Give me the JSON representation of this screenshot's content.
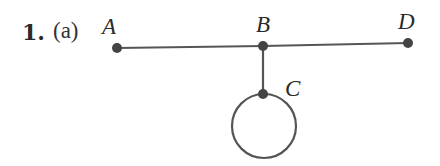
{
  "problem": {
    "number": "1.",
    "part": "(a)"
  },
  "graph": {
    "vertices": [
      {
        "id": "A",
        "label": "A",
        "x": 117,
        "y": 48,
        "label_x": 102,
        "label_y": 14
      },
      {
        "id": "B",
        "label": "B",
        "x": 263,
        "y": 46,
        "label_x": 256,
        "label_y": 12
      },
      {
        "id": "D",
        "label": "D",
        "x": 408,
        "y": 43,
        "label_x": 398,
        "label_y": 9
      },
      {
        "id": "C",
        "label": "C",
        "x": 263,
        "y": 94,
        "label_x": 285,
        "label_y": 76
      }
    ],
    "edges": [
      {
        "from": "A",
        "to": "B"
      },
      {
        "from": "B",
        "to": "D"
      },
      {
        "from": "B",
        "to": "C"
      },
      {
        "from": "C",
        "to": "C",
        "type": "loop"
      }
    ],
    "colors": {
      "edge": "#555555",
      "vertex": "#444444"
    }
  }
}
